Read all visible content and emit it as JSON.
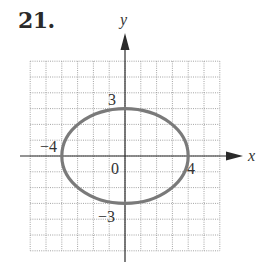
{
  "problem": {
    "number": "21."
  },
  "chart_data": {
    "type": "diagram",
    "title": "21.",
    "xlabel": "x",
    "ylabel": "y",
    "xlim": [
      -6,
      6
    ],
    "ylim": [
      -6,
      6
    ],
    "grid": true,
    "grid_style": "dotted",
    "curve": {
      "shape": "ellipse",
      "center": [
        0,
        0
      ],
      "semi_axis_x": 4,
      "semi_axis_y": 3,
      "equation": "x^2/16 + y^2/9 = 1",
      "stroke_color": "#7a7a7a"
    },
    "annotations": [
      {
        "text": "3",
        "at": [
          0,
          3
        ]
      },
      {
        "text": "−4",
        "at": [
          -4,
          0
        ]
      },
      {
        "text": "0",
        "at": [
          0,
          0
        ]
      },
      {
        "text": "4",
        "at": [
          4,
          0
        ]
      },
      {
        "text": "−3",
        "at": [
          0,
          -3
        ]
      }
    ]
  },
  "labels": {
    "x_axis": "x",
    "y_axis": "y",
    "origin": "0",
    "y_pos": "3",
    "y_neg": "−3",
    "x_pos": "4",
    "x_neg": "−4"
  },
  "colors": {
    "axis": "#2a2a2a",
    "grid": "#9a9a9a",
    "ellipse": "#7a7a7a"
  }
}
